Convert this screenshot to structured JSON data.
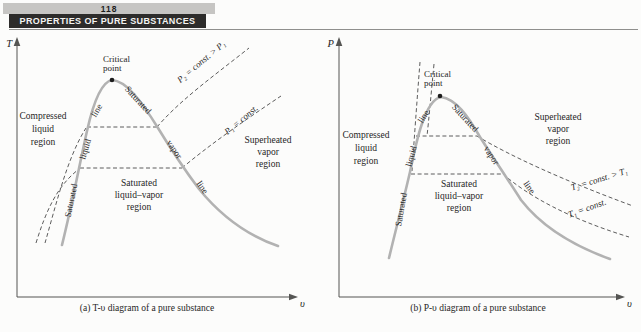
{
  "page": {
    "number": "118",
    "chapter_header": "PROPERTIES OF PURE SUBSTANCES"
  },
  "colors": {
    "saturation_curve": "#b2b2b2",
    "dashed_line": "#4a4a4a",
    "header_bar_bg": "#2d2c2b",
    "header_bar_text": "#f4f4f2",
    "page_number_bg": "#c6c5c3",
    "diagram_text": "#262626"
  },
  "diagram_a": {
    "y_axis_label": "T",
    "x_axis_label": "υ",
    "critical_point": {
      "line1": "Critical",
      "line2": "point"
    },
    "saturated_liquid_line": {
      "word1": "Saturated",
      "word2": "liquid",
      "word3": "line"
    },
    "saturated_vapor_line": {
      "word1": "Saturated",
      "word2": "vapor",
      "word3": "line"
    },
    "compressed_liquid_region": {
      "line1": "Compressed",
      "line2": "liquid",
      "line3": "region"
    },
    "saturated_mixture_region": {
      "line1": "Saturated",
      "line2": "liquid–vapor",
      "line3": "region"
    },
    "superheated_vapor_region": {
      "line1": "Superheated",
      "line2": "vapor",
      "line3": "region"
    },
    "isobar_p2_label": "P₂ = const. > P₁",
    "isobar_p1_label": "P₁ = const.",
    "caption": "(a) T-υ diagram of a pure substance"
  },
  "diagram_b": {
    "y_axis_label": "P",
    "x_axis_label": "υ",
    "critical_point": {
      "line1": "Critical",
      "line2": "point"
    },
    "saturated_liquid_line": {
      "word1": "Saturated",
      "word2": "liquid",
      "word3": "line"
    },
    "saturated_vapor_line": {
      "word1": "Saturated",
      "word2": "vapor",
      "word3": "line"
    },
    "compressed_liquid_region": {
      "line1": "Compressed",
      "line2": "liquid",
      "line3": "region"
    },
    "saturated_mixture_region": {
      "line1": "Saturated",
      "line2": "liquid–vapor",
      "line3": "region"
    },
    "superheated_vapor_region": {
      "line1": "Superheated",
      "line2": "vapor",
      "line3": "region"
    },
    "isotherm_t2_label": "T₂ = const. > T₁",
    "isotherm_t1_label": "T₁ = const.",
    "caption": "(b) P-υ diagram of a pure substance"
  }
}
